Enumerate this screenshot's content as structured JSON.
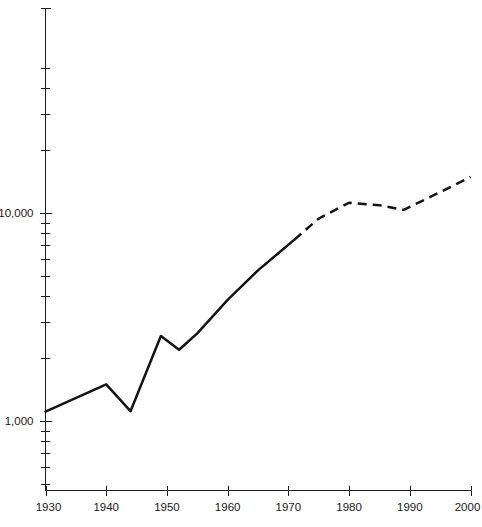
{
  "chart_data": {
    "type": "line",
    "title": "",
    "subtitle": "",
    "xlabel": "",
    "ylabel": "",
    "yscale": "log",
    "xlim": [
      1930,
      2000
    ],
    "ylim": [
      400,
      60000
    ],
    "grid": false,
    "legend": null,
    "legend_position": "none",
    "x_ticks": [
      1930,
      1940,
      1950,
      1960,
      1970,
      1980,
      1990,
      2000
    ],
    "x_tick_labels": [
      "1930",
      "1940",
      "1950",
      "1960",
      "1970",
      "1980",
      "1990",
      "2000"
    ],
    "y_ticks_major": [
      1000,
      10000
    ],
    "y_tick_labels_major": [
      "1,000",
      "10,000"
    ],
    "y_ticks_minor": [
      500,
      600,
      700,
      800,
      900,
      2000,
      3000,
      4000,
      5000,
      6000,
      7000,
      8000,
      9000,
      20000,
      30000,
      40000,
      50000
    ],
    "series": [
      {
        "name": "observed",
        "style": "solid",
        "x": [
          1930,
          1940,
          1944,
          1949,
          1952,
          1955,
          1960,
          1965,
          1971
        ],
        "values": [
          1110,
          1500,
          1115,
          2560,
          2200,
          2640,
          3820,
          5300,
          7450
        ]
      },
      {
        "name": "projected",
        "style": "dashed",
        "x": [
          1971,
          1975,
          1980,
          1985,
          1989,
          1995,
          2000
        ],
        "values": [
          7450,
          9400,
          11200,
          10900,
          10350,
          12600,
          14900
        ]
      }
    ],
    "annotations": []
  },
  "axis": {
    "y_label_10000": "10,000",
    "y_label_1000": "1,000",
    "x_label_1930": "1930",
    "x_label_1940": "1940",
    "x_label_1950": "1950",
    "x_label_1960": "1960",
    "x_label_1970": "1970",
    "x_label_1980": "1980",
    "x_label_1990": "1990",
    "x_label_2000": "2000"
  },
  "colors": {
    "line": "#141414",
    "axis": "#1c1c1c",
    "text": "#1a1a1a",
    "background": "#ffffff"
  }
}
